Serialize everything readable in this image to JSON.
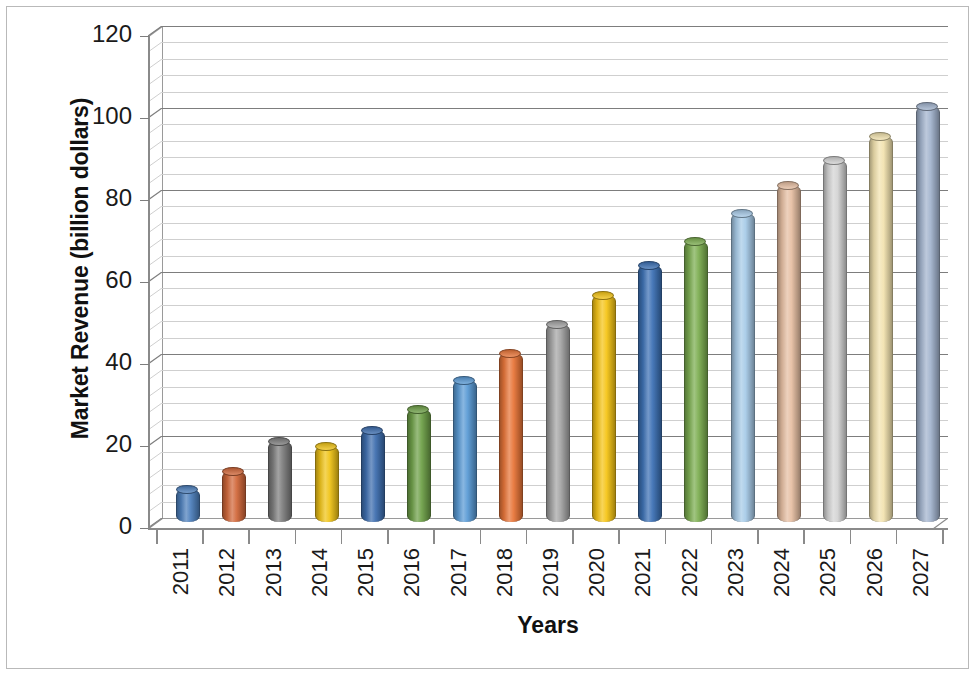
{
  "chart_data": {
    "type": "bar",
    "title": "",
    "subtitle": "",
    "xlabel": "Years",
    "ylabel": "Market Revenue (billion dollars)",
    "categories": [
      "2011",
      "2012",
      "2013",
      "2014",
      "2015",
      "2016",
      "2017",
      "2018",
      "2019",
      "2020",
      "2021",
      "2022",
      "2023",
      "2024",
      "2025",
      "2026",
      "2027"
    ],
    "values": [
      8.1,
      12.6,
      19.8,
      18.6,
      22.6,
      27.8,
      34.7,
      41.4,
      48.4,
      55.4,
      62.9,
      68.6,
      75.6,
      82.4,
      88.4,
      94.2,
      101.6
    ],
    "series": [
      {
        "name": "Market Revenue",
        "values": [
          8.1,
          12.6,
          19.8,
          18.6,
          22.6,
          27.8,
          34.7,
          41.4,
          48.4,
          55.4,
          62.9,
          68.6,
          75.6,
          82.4,
          88.4,
          94.2,
          101.6
        ]
      }
    ],
    "bar_colors": [
      "#4F81BD",
      "#D2693C",
      "#7F7F7F",
      "#F0C419",
      "#3F6FAF",
      "#70A14A",
      "#5B9BD5",
      "#E8763A",
      "#A6A6A6",
      "#F5C518",
      "#3E72B5",
      "#7DAE52",
      "#A8CBE8",
      "#E6BFA3",
      "#D4D4D4",
      "#F2E3B0",
      "#A3B4CE"
    ],
    "ytick_labels": [
      "0",
      "20",
      "40",
      "60",
      "80",
      "100",
      "120"
    ],
    "ytick_values": [
      0,
      20,
      40,
      60,
      80,
      100,
      120
    ],
    "ylim": [
      0,
      120
    ],
    "y_major_step": 20,
    "y_minor_step": 4,
    "grid": true,
    "grid_orientation": "horizontal",
    "legend": false,
    "legend_position": "none",
    "style": "3d-cylinder",
    "accent_color": "#4F81BD",
    "gridline_major_color": "#7d7d7d",
    "gridline_minor_color": "#cfcfcf",
    "axis_color": "#8a8a8a",
    "text_color": "#1a1a1a",
    "background_color": "#ffffff",
    "border_color": "#b9b9b9"
  }
}
